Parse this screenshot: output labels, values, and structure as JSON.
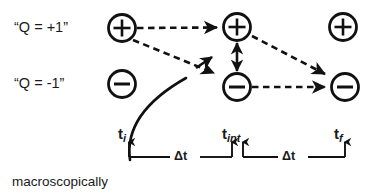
{
  "figure": {
    "background": "#ffffff",
    "stroke_color": "#111111",
    "text_color": "#1a1a1a",
    "width": 381,
    "height": 195
  },
  "labels": {
    "q_plus": "“Q = +1”",
    "q_minus": "“Q = -1”",
    "caption": "macroscopically"
  },
  "nodes": [
    {
      "id": "plus-initial",
      "glyph": "+",
      "cx": 122,
      "cy": 28,
      "r": 13.5,
      "row": "Q = +1",
      "column": "t_i"
    },
    {
      "id": "plus-interaction",
      "glyph": "+",
      "cx": 237,
      "cy": 27,
      "r": 13.5,
      "row": "Q = +1",
      "column": "t_int"
    },
    {
      "id": "plus-final",
      "glyph": "+",
      "cx": 343,
      "cy": 27,
      "r": 13.5,
      "row": "Q = +1",
      "column": "t_f"
    },
    {
      "id": "minus-initial",
      "glyph": "−",
      "cx": 122,
      "cy": 84,
      "r": 13.5,
      "row": "Q = -1",
      "column": "t_i"
    },
    {
      "id": "minus-interaction",
      "glyph": "−",
      "cx": 237,
      "cy": 87,
      "r": 13.5,
      "row": "Q = -1",
      "column": "t_int"
    },
    {
      "id": "minus-final",
      "glyph": "−",
      "cx": 345,
      "cy": 87,
      "r": 13.5,
      "row": "Q = -1",
      "column": "t_f"
    }
  ],
  "timeline": {
    "baseline_y": 157,
    "ticks": [
      {
        "id": "t_i",
        "base": "t",
        "sub": "i",
        "x": 129
      },
      {
        "id": "t_int_a",
        "base": "",
        "sub": "",
        "x": 232
      },
      {
        "id": "t_int_b",
        "base": "t",
        "sub": "int",
        "x": 243
      },
      {
        "id": "t_f",
        "base": "t",
        "sub": "f",
        "x": 345
      }
    ],
    "tick_labels": [
      {
        "id": "t_i",
        "base": "t",
        "sub": "i"
      },
      {
        "id": "t_int",
        "base": "t",
        "sub": "int"
      },
      {
        "id": "t_f",
        "base": "t",
        "sub": "f"
      }
    ],
    "intervals": [
      {
        "id": "interval-1",
        "label": "Δt",
        "from": "t_i",
        "to": "t_int"
      },
      {
        "id": "interval-2",
        "label": "Δt",
        "from": "t_int",
        "to": "t_f"
      }
    ]
  },
  "edges": [
    {
      "id": "plus-i-to-plus-int",
      "style": "dashed",
      "from": "plus-initial",
      "to": "plus-interaction",
      "arrow": "single"
    },
    {
      "id": "plus-i-to-minus-int",
      "style": "dashed",
      "from": "plus-initial",
      "to": "minus-interaction",
      "arrow": "single"
    },
    {
      "id": "plus-int-to-minus-f",
      "style": "dashed",
      "from": "plus-interaction",
      "to": "minus-final",
      "arrow": "single"
    },
    {
      "id": "minus-int-to-minus-f",
      "style": "dashed",
      "from": "minus-interaction",
      "to": "minus-final",
      "arrow": "single"
    },
    {
      "id": "interaction-exchange",
      "style": "solid",
      "from": "plus-interaction",
      "to": "minus-interaction",
      "arrow": "double"
    },
    {
      "id": "worldline-incoming",
      "style": "solid",
      "from": "timeline-t_i",
      "to": "midfield",
      "arrow": "none"
    },
    {
      "id": "short-solid-arrow",
      "style": "solid",
      "from": "midfield",
      "to": "minus-interaction",
      "arrow": "single"
    }
  ]
}
